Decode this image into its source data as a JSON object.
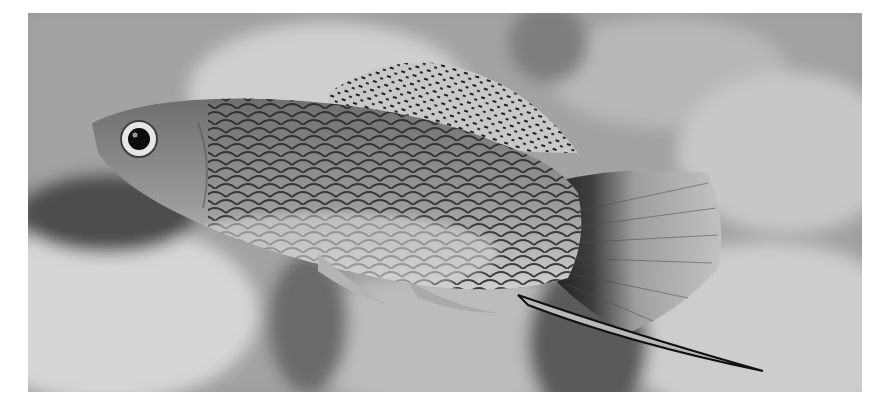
{
  "image": {
    "subject": "fish",
    "description": "Grayscale photograph of a male swordtail/molly-type fish swimming left, with dark net-patterned scales, speckled sail-like dorsal fin, fan tail with a dark band at its base and a long lower sword extension, over blurred pebbles and plants.",
    "palette": {
      "background": "#ffffff",
      "frame": "#9a9a9a",
      "rocks_light": "#d4d4d4",
      "rocks_mid": "#b0b0b0",
      "shadow": "#4a4a4a",
      "body": "#8c8c8c",
      "belly": "#c6c6c6",
      "scale_lines": "#2a2a2a",
      "fin": "#bdbdbd",
      "eye_ring": "#e8e8e8",
      "pupil": "#0d0d0d"
    }
  }
}
